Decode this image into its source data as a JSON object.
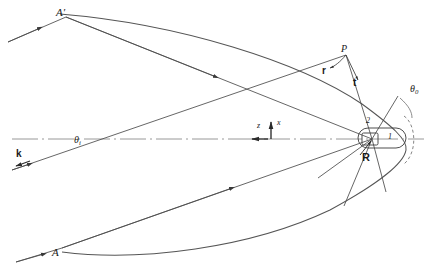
{
  "figure": {
    "type": "geometric-optics-diagram",
    "width": 430,
    "height": 272,
    "background_color": "#ffffff",
    "stroke_color": "#4a4a4a",
    "text_color": "#1a1a1a"
  },
  "labels": {
    "a_prime": "A′",
    "a": "A",
    "p": "P",
    "vec_r": "r",
    "vec_t": "t",
    "vec_R": "R",
    "theta_i_base": "θ",
    "theta_i_sub": "i",
    "theta_0_base": "θ",
    "theta_0_sub": "0",
    "axis_z": "z",
    "axis_x": "x",
    "wave_k": "k",
    "region_one": "1",
    "region_two": "2"
  },
  "geometry": {
    "parabola_vertex": [
      406,
      138
    ],
    "focus": [
      372,
      139
    ],
    "point_P": [
      346,
      55
    ],
    "point_A_prime": [
      66,
      17
    ],
    "point_A": [
      62,
      248
    ],
    "optic_axis_y": 139,
    "optic_axis_x_range": [
      12,
      424
    ]
  },
  "legend": {
    "incident_ray_label": "k",
    "angle_of_incidence": "θi",
    "aperture_angle": "θ0"
  }
}
